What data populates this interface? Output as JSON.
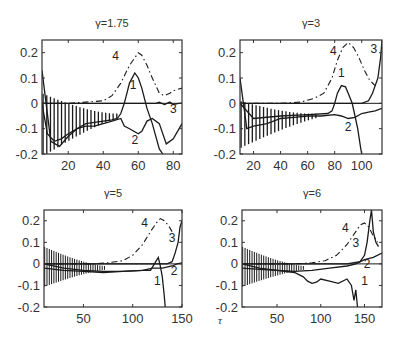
{
  "figure": {
    "xlabel": "τ",
    "line_color": "#1a1a1a",
    "axis_color": "#333333"
  },
  "chart_data": [
    {
      "type": "line",
      "title": "γ=1.75",
      "xlabel": "",
      "ylabel": "",
      "xlim": [
        5,
        85
      ],
      "ylim": [
        -0.2,
        0.25
      ],
      "xticks": [
        20,
        40,
        60,
        80
      ],
      "yticks": [
        -0.2,
        -0.1,
        0,
        0.1,
        0.2
      ],
      "ytick_labels": [
        "-0.2",
        "-0.1",
        "0",
        "0.1",
        "0.2"
      ],
      "grid": false,
      "series": [
        {
          "name": "1",
          "style": "solid",
          "x": [
            5,
            8,
            12,
            16,
            20,
            25,
            30,
            35,
            40,
            45,
            48,
            50,
            52,
            55,
            58,
            60,
            62,
            65,
            68,
            70,
            72,
            74
          ],
          "y": [
            0.0,
            -0.12,
            -0.15,
            -0.14,
            -0.12,
            -0.1,
            -0.08,
            -0.075,
            -0.07,
            -0.065,
            -0.06,
            -0.04,
            0.0,
            0.08,
            0.12,
            0.1,
            0.06,
            -0.02,
            -0.08,
            -0.13,
            -0.18,
            -0.2
          ]
        },
        {
          "name": "2",
          "style": "solid",
          "x": [
            5,
            10,
            15,
            20,
            25,
            30,
            35,
            40,
            45,
            50,
            52,
            55,
            60,
            62,
            65,
            68,
            72,
            76,
            80,
            85
          ],
          "y": [
            0.13,
            -0.15,
            -0.17,
            -0.13,
            -0.1,
            -0.09,
            -0.09,
            -0.08,
            -0.07,
            -0.06,
            -0.09,
            -0.1,
            -0.12,
            -0.11,
            -0.07,
            -0.06,
            -0.08,
            -0.16,
            -0.14,
            -0.08
          ]
        },
        {
          "name": "3",
          "style": "solid",
          "x": [
            5,
            10,
            20,
            40,
            60,
            70,
            72,
            75,
            78,
            80,
            83,
            85
          ],
          "y": [
            0.0,
            0.0,
            0.0,
            0.0,
            0.0,
            0.0,
            0.005,
            -0.005,
            0.005,
            -0.005,
            0.0,
            0.0
          ]
        },
        {
          "name": "4",
          "style": "dashdot",
          "x": [
            5,
            20,
            30,
            40,
            45,
            50,
            55,
            58,
            60,
            62,
            65,
            68,
            70,
            72,
            75,
            78,
            80,
            85
          ],
          "y": [
            0.0,
            0.0,
            0.005,
            0.01,
            0.03,
            0.08,
            0.15,
            0.18,
            0.2,
            0.19,
            0.15,
            0.1,
            0.07,
            0.04,
            0.03,
            0.04,
            0.05,
            0.06
          ]
        }
      ],
      "annotations": [
        {
          "text": "1",
          "x": 57,
          "y": 0.055
        },
        {
          "text": "2",
          "x": 58,
          "y": -0.16
        },
        {
          "text": "3",
          "x": 80,
          "y": -0.04
        },
        {
          "text": "4",
          "x": 47,
          "y": 0.17
        }
      ]
    },
    {
      "type": "line",
      "title": "γ=3",
      "xlabel": "",
      "ylabel": "",
      "xlim": [
        10,
        115
      ],
      "ylim": [
        -0.2,
        0.25
      ],
      "xticks": [
        20,
        40,
        60,
        80,
        100
      ],
      "yticks": [
        -0.2,
        -0.1,
        0,
        0.1,
        0.2
      ],
      "ytick_labels": [
        "-0.2",
        "-0.1",
        "0",
        "0.1",
        "0.2"
      ],
      "grid": false,
      "series": [
        {
          "name": "1",
          "style": "solid",
          "x": [
            10,
            20,
            40,
            60,
            75,
            78,
            80,
            82,
            85,
            88,
            90,
            93,
            95,
            97,
            99,
            100
          ],
          "y": [
            0.0,
            -0.06,
            -0.05,
            -0.045,
            -0.04,
            -0.03,
            0.0,
            0.04,
            0.07,
            0.065,
            0.04,
            0.0,
            -0.05,
            -0.1,
            -0.17,
            -0.2
          ]
        },
        {
          "name": "2",
          "style": "solid",
          "x": [
            10,
            15,
            20,
            30,
            40,
            50,
            60,
            70,
            80,
            85,
            90,
            95,
            100,
            105,
            110,
            115
          ],
          "y": [
            0.1,
            -0.1,
            -0.09,
            -0.08,
            -0.06,
            -0.055,
            -0.05,
            -0.05,
            -0.045,
            -0.05,
            -0.06,
            -0.055,
            -0.04,
            -0.035,
            -0.03,
            -0.02
          ]
        },
        {
          "name": "3",
          "style": "solid",
          "x": [
            10,
            50,
            90,
            100,
            105,
            108,
            110,
            112,
            114,
            115
          ],
          "y": [
            0.0,
            0.0,
            0.0,
            0.0,
            0.01,
            0.04,
            0.07,
            0.1,
            0.18,
            0.25
          ]
        },
        {
          "name": "4",
          "style": "dashdot",
          "x": [
            10,
            40,
            55,
            65,
            72,
            78,
            82,
            86,
            90,
            94,
            98,
            102,
            106,
            110
          ],
          "y": [
            0.0,
            0.0,
            0.005,
            0.02,
            0.04,
            0.1,
            0.17,
            0.22,
            0.24,
            0.22,
            0.18,
            0.13,
            0.09,
            0.07
          ]
        }
      ],
      "annotations": [
        {
          "text": "1",
          "x": 85,
          "y": 0.105
        },
        {
          "text": "2",
          "x": 90,
          "y": -0.11
        },
        {
          "text": "3",
          "x": 109,
          "y": 0.2
        },
        {
          "text": "4",
          "x": 79,
          "y": 0.19
        }
      ]
    },
    {
      "type": "line",
      "title": "γ=5",
      "xlabel": "",
      "ylabel": "",
      "xlim": [
        10,
        150
      ],
      "ylim": [
        -0.2,
        0.25
      ],
      "xticks": [
        50,
        100,
        150
      ],
      "yticks": [
        -0.2,
        -0.1,
        0,
        0.1,
        0.2
      ],
      "ytick_labels": [
        "-0.2",
        "-0.1",
        "0",
        "0.1",
        "0.2"
      ],
      "grid": false,
      "series": [
        {
          "name": "1",
          "style": "solid",
          "x": [
            10,
            30,
            50,
            70,
            90,
            110,
            118,
            122,
            126,
            128,
            130,
            132,
            133
          ],
          "y": [
            0.0,
            -0.02,
            -0.03,
            -0.035,
            -0.035,
            -0.03,
            -0.03,
            0.0,
            0.03,
            -0.01,
            -0.06,
            -0.15,
            -0.2
          ]
        },
        {
          "name": "2",
          "style": "solid",
          "x": [
            10,
            30,
            50,
            70,
            90,
            110,
            120,
            130,
            140,
            145,
            150
          ],
          "y": [
            -0.02,
            -0.03,
            -0.035,
            -0.04,
            -0.035,
            -0.03,
            -0.02,
            -0.02,
            -0.01,
            0.0,
            0.005
          ]
        },
        {
          "name": "3",
          "style": "solid",
          "x": [
            10,
            60,
            120,
            135,
            140,
            143,
            146,
            148,
            150
          ],
          "y": [
            0.0,
            0.0,
            0.0,
            0.0,
            0.01,
            0.05,
            0.1,
            0.17,
            0.2
          ]
        },
        {
          "name": "4",
          "style": "dashdot",
          "x": [
            10,
            60,
            75,
            90,
            100,
            110,
            118,
            124,
            128,
            132,
            136,
            140
          ],
          "y": [
            0.0,
            0.0,
            0.005,
            0.015,
            0.04,
            0.09,
            0.15,
            0.19,
            0.21,
            0.2,
            0.18,
            0.15
          ]
        }
      ],
      "annotations": [
        {
          "text": "1",
          "x": 125,
          "y": -0.1
        },
        {
          "text": "2",
          "x": 142,
          "y": -0.05
        },
        {
          "text": "3",
          "x": 140,
          "y": 0.1
        },
        {
          "text": "4",
          "x": 112,
          "y": 0.17
        }
      ]
    },
    {
      "type": "line",
      "title": "γ=6",
      "xlabel": "τ",
      "ylabel": "",
      "xlim": [
        10,
        170
      ],
      "ylim": [
        -0.2,
        0.25
      ],
      "xticks": [
        50,
        100,
        150
      ],
      "yticks": [
        -0.2,
        -0.1,
        0,
        0.1,
        0.2
      ],
      "ytick_labels": [
        "-0.2",
        "-0.1",
        "0",
        "0.1",
        "0.2"
      ],
      "grid": false,
      "series": [
        {
          "name": "1",
          "style": "solid",
          "x": [
            10,
            30,
            50,
            70,
            80,
            85,
            90,
            95,
            100,
            110,
            120,
            130,
            135,
            138,
            140,
            142
          ],
          "y": [
            0.0,
            -0.02,
            -0.03,
            -0.04,
            -0.06,
            -0.08,
            -0.09,
            -0.085,
            -0.07,
            -0.08,
            -0.09,
            -0.07,
            -0.1,
            -0.17,
            -0.12,
            -0.2
          ]
        },
        {
          "name": "2",
          "style": "solid",
          "x": [
            10,
            30,
            50,
            70,
            90,
            110,
            130,
            140,
            150,
            160,
            170
          ],
          "y": [
            -0.02,
            -0.025,
            -0.03,
            -0.035,
            -0.03,
            -0.02,
            -0.01,
            0.0,
            0.02,
            0.03,
            0.05
          ]
        },
        {
          "name": "3",
          "style": "solid",
          "x": [
            10,
            60,
            130,
            145,
            150,
            153,
            156,
            158,
            160,
            163,
            166
          ],
          "y": [
            0.0,
            0.0,
            0.0,
            0.01,
            0.04,
            0.1,
            0.2,
            0.25,
            0.15,
            0.1,
            0.08
          ]
        },
        {
          "name": "4",
          "style": "dashdot",
          "x": [
            10,
            70,
            90,
            105,
            118,
            130,
            140,
            145,
            150,
            155,
            160,
            165
          ],
          "y": [
            0.0,
            0.0,
            0.005,
            0.015,
            0.04,
            0.09,
            0.15,
            0.18,
            0.19,
            0.17,
            0.13,
            0.1
          ]
        }
      ],
      "annotations": [
        {
          "text": "1",
          "x": 150,
          "y": -0.1
        },
        {
          "text": "2",
          "x": 153,
          "y": -0.02
        },
        {
          "text": "3",
          "x": 140,
          "y": 0.08
        },
        {
          "text": "4",
          "x": 128,
          "y": 0.15
        }
      ]
    }
  ],
  "layout": {
    "panels": [
      {
        "frame": [
          42,
          40,
          182,
          154
        ],
        "title_pos": [
          112,
          27
        ]
      },
      {
        "frame": [
          240,
          40,
          382,
          154
        ],
        "title_pos": [
          311,
          27
        ]
      },
      {
        "frame": [
          44,
          210,
          182,
          307
        ],
        "title_pos": [
          113,
          197
        ]
      },
      {
        "frame": [
          242,
          210,
          382,
          307
        ],
        "title_pos": [
          312,
          197
        ]
      }
    ],
    "xlabel_pos": [
      218,
      324
    ]
  }
}
